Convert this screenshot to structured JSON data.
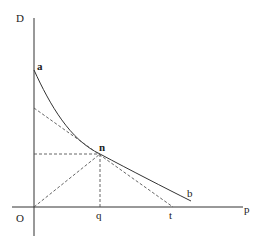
{
  "diagram": {
    "type": "economics-demand-curve-elasticity",
    "axes": {
      "y_label": "D",
      "x_label": "p",
      "origin_label": "O"
    },
    "curve": {
      "start_label": "a",
      "end_label": "b",
      "tangent_point_label": "n"
    },
    "points": {
      "q_label": "q",
      "t_label": "t"
    },
    "colors": {
      "line": "#333333",
      "dashed": "#555555",
      "background": "#ffffff"
    }
  }
}
